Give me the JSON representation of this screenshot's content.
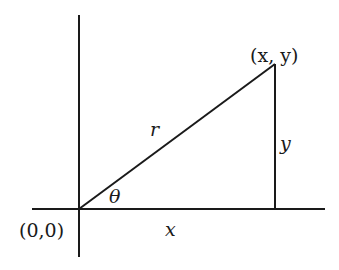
{
  "diagram": {
    "labels": {
      "point": "(x, y)",
      "hypotenuse": "r",
      "opposite": "y",
      "angle": "θ",
      "origin": "(0,0)",
      "adjacent": "x"
    },
    "colors": {
      "line": "#1a1a1a",
      "background": "#ffffff"
    }
  }
}
